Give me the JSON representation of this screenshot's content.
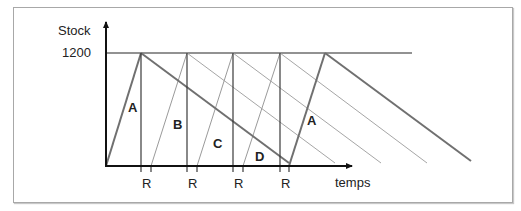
{
  "diagram": {
    "y_axis_label": "Stock",
    "y_level_label": "1200",
    "x_axis_label": "temps",
    "reorder_marker_label": "R",
    "region_labels": [
      "A",
      "B",
      "C",
      "D",
      "A"
    ],
    "colors": {
      "axis": "#111111",
      "thick_line": "#6e6e6e",
      "thin_line": "#a0a0a0",
      "vertical": "#3a3a3a",
      "frame": "#a8a8a8"
    }
  }
}
